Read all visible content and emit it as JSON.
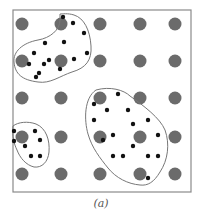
{
  "figure": {
    "caption": "(a)",
    "colors": {
      "frame": "#8a8a8a",
      "grid_dot": "#6b6b6b",
      "sample_dot": "#111111",
      "region_outline": "#777777"
    },
    "frame": {
      "x": 13,
      "y": 10,
      "width": 178,
      "height": 182
    },
    "grid": {
      "columns_x": [
        22,
        61,
        100,
        140,
        175
      ],
      "rows_y": [
        24,
        61,
        98,
        137,
        174
      ],
      "radius": 6.5
    },
    "regions": [
      {
        "name": "region-top-left",
        "path": "M60,14 L60,20 C60,30 50,38 38,40 C22,43 13,52 14,62 C15,74 22,80 38,82 C50,84 60,76 72,72 C86,68 92,60 91,46 C90,30 84,18 74,15 C68,13 62,14 60,14 Z",
        "dots": [
          [
            63,
            17
          ],
          [
            73,
            23
          ],
          [
            84,
            33
          ],
          [
            45,
            43
          ],
          [
            64,
            42
          ],
          [
            34,
            53
          ],
          [
            87,
            53
          ],
          [
            74,
            59
          ],
          [
            49,
            60
          ],
          [
            29,
            64
          ],
          [
            44,
            64
          ],
          [
            60,
            69
          ],
          [
            39,
            73
          ],
          [
            36,
            77
          ]
        ]
      },
      {
        "name": "region-bottom-left",
        "path": "M13,126 C18,122 28,121 36,124 C46,128 50,140 49,152 C48,162 42,168 34,167 C26,165 20,158 17,150 C14,144 12,136 13,126 Z",
        "dots": [
          [
            14,
            131
          ],
          [
            14,
            141
          ],
          [
            35,
            131
          ],
          [
            40,
            140
          ],
          [
            25,
            146
          ],
          [
            31,
            156
          ],
          [
            40,
            156
          ]
        ]
      },
      {
        "name": "region-bottom-right",
        "path": "M96,90 C110,86 124,90 130,96 C144,106 160,118 165,130 C170,144 168,160 160,172 C154,182 148,186 140,185 C128,184 116,178 108,168 C100,158 92,148 88,134 C84,120 84,98 96,90 Z",
        "dots": [
          [
            118,
            94
          ],
          [
            94,
            104
          ],
          [
            107,
            110
          ],
          [
            128,
            110
          ],
          [
            94,
            120
          ],
          [
            133,
            124
          ],
          [
            148,
            120
          ],
          [
            113,
            135
          ],
          [
            103,
            140
          ],
          [
            158,
            135
          ],
          [
            133,
            146
          ],
          [
            113,
            156
          ],
          [
            123,
            156
          ],
          [
            148,
            156
          ],
          [
            158,
            156
          ],
          [
            148,
            178
          ]
        ]
      }
    ]
  }
}
